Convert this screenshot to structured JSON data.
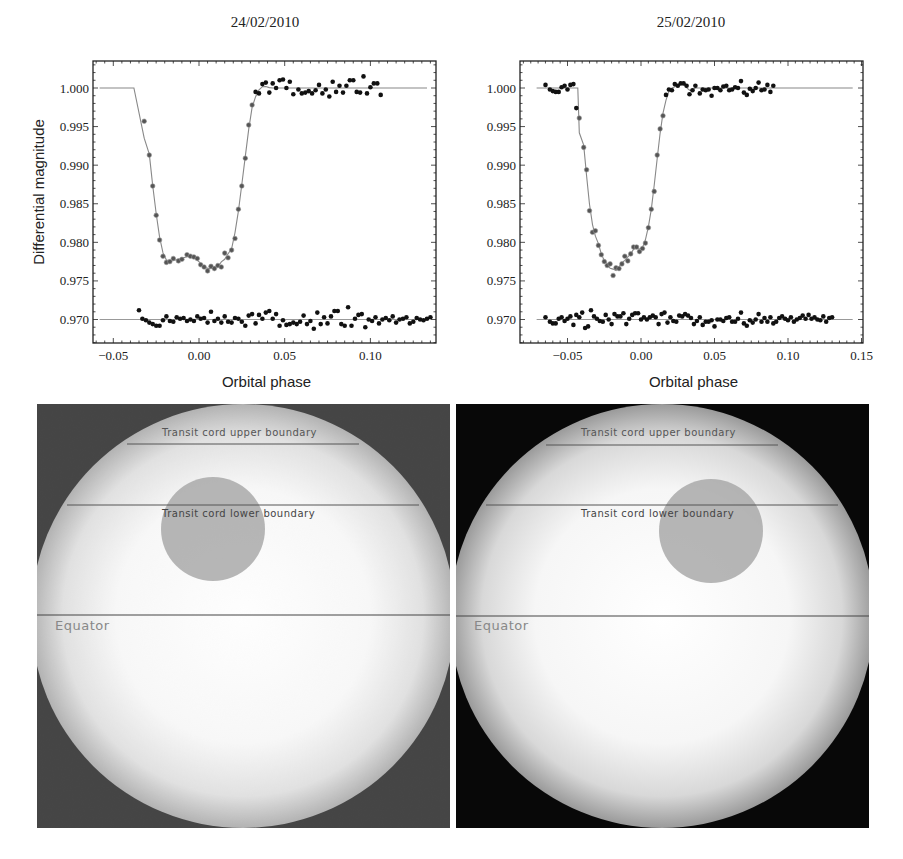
{
  "chart_data": [
    {
      "type": "scatter",
      "title": "24/02/2010",
      "xlabel": "Orbital phase",
      "ylabel": "Differential magnitude",
      "xlim": [
        -0.063,
        0.137
      ],
      "ylim": [
        0.9667,
        1.0035
      ],
      "xticks": [
        -0.05,
        0.0,
        0.05,
        0.1
      ],
      "xtick_labels": [
        "−0.05",
        "0.00",
        "0.05",
        "0.10"
      ],
      "yticks": [
        1.0,
        0.995,
        0.99,
        0.985,
        0.98,
        0.975,
        0.97
      ],
      "ytick_labels": [
        "1.000",
        "0.995",
        "0.990",
        "0.985",
        "0.980",
        "0.975",
        "0.970"
      ],
      "grid": false,
      "series": [
        {
          "name": "observed light curve",
          "style": "points",
          "x": [
            -0.032,
            -0.029,
            -0.027,
            -0.025,
            -0.023,
            -0.021,
            -0.019,
            -0.017,
            -0.015,
            -0.012,
            -0.01,
            -0.007,
            -0.005,
            -0.003,
            -0.001,
            0.001,
            0.003,
            0.005,
            0.007,
            0.009,
            0.011,
            0.013,
            0.015,
            0.017,
            0.019,
            0.021,
            0.023,
            0.025,
            0.027,
            0.029,
            0.031,
            0.033,
            0.035,
            0.037,
            0.039,
            0.041,
            0.043,
            0.045,
            0.047,
            0.049,
            0.051,
            0.053,
            0.055,
            0.058,
            0.06,
            0.062,
            0.064,
            0.066,
            0.068,
            0.07,
            0.072,
            0.074,
            0.076,
            0.078,
            0.08,
            0.082,
            0.084,
            0.086,
            0.088,
            0.09,
            0.092,
            0.094,
            0.096,
            0.098,
            0.1,
            0.102,
            0.104,
            0.106,
            0.108,
            0.11,
            0.112,
            0.114,
            0.116,
            0.118,
            0.12,
            0.122,
            0.124,
            0.126,
            0.128,
            0.13,
            0.132,
            0.134,
            0.136
          ],
          "y": [
            0.9957,
            0.9913,
            0.9873,
            0.9835,
            0.9803,
            0.9782,
            0.9774,
            0.9775,
            0.9779,
            0.9776,
            0.9778,
            0.9784,
            0.9782,
            0.9781,
            0.9779,
            0.9771,
            0.9768,
            0.9763,
            0.9769,
            0.9766,
            0.977,
            0.9768,
            0.9786,
            0.978,
            0.979,
            0.9805,
            0.9843,
            0.9873,
            0.9909,
            0.9952,
            0.9978,
            0.9995,
            0.9993,
            1.0005,
            1.0007,
            0.9994,
            1.0006,
            1.0,
            1.001,
            1.0011,
            1.0,
            1.0008,
            0.9992,
            0.9998,
            0.9993,
            0.9994,
            0.9996,
            0.9993,
            0.9997,
            1.0004,
            0.9993,
            0.9998,
            0.9989,
            1.0008,
            0.9995,
            1.0003,
            0.9994,
            1.0003,
            1.001,
            1.001,
            0.9995,
            0.9994,
            1.0015,
            0.9993,
            1.0001,
            1.0006,
            1.0006,
            0.9991
          ],
          "x_note": "x/y arrays are paired; points spanning full transit"
        },
        {
          "name": "model fit",
          "style": "line",
          "depth_center": 0.9765,
          "ingress_start": -0.038,
          "egress_end": 0.043,
          "baseline": 1.0
        },
        {
          "name": "residuals (offset 0.970)",
          "style": "points",
          "x": [
            -0.035,
            -0.033,
            -0.031,
            -0.029,
            -0.027,
            -0.025,
            -0.023,
            -0.021,
            -0.019,
            -0.017,
            -0.015,
            -0.013,
            -0.011,
            -0.009,
            -0.007,
            -0.005,
            -0.003,
            -0.001,
            0.001,
            0.003,
            0.005,
            0.007,
            0.009,
            0.011,
            0.013,
            0.015,
            0.017,
            0.019,
            0.021,
            0.023,
            0.025,
            0.027,
            0.029,
            0.031,
            0.033,
            0.035,
            0.037,
            0.039,
            0.041,
            0.043,
            0.045,
            0.047,
            0.049,
            0.051,
            0.053,
            0.055,
            0.057,
            0.059,
            0.061,
            0.063,
            0.065,
            0.067,
            0.069,
            0.071,
            0.073,
            0.075,
            0.077,
            0.079,
            0.081,
            0.083,
            0.085,
            0.087,
            0.089,
            0.091,
            0.093,
            0.095,
            0.097,
            0.099,
            0.101,
            0.103,
            0.105,
            0.107,
            0.109,
            0.111,
            0.113,
            0.115,
            0.117,
            0.119,
            0.121,
            0.123,
            0.125,
            0.127,
            0.129,
            0.131,
            0.133,
            0.135
          ],
          "y": [
            0.9712,
            0.9701,
            0.9699,
            0.9696,
            0.9694,
            0.9692,
            0.9692,
            0.9699,
            0.9704,
            0.9698,
            0.9697,
            0.9703,
            0.9701,
            0.9702,
            0.9698,
            0.97,
            0.9698,
            0.9704,
            0.9701,
            0.9702,
            0.9696,
            0.971,
            0.9698,
            0.9701,
            0.9696,
            0.9704,
            0.9697,
            0.9696,
            0.9702,
            0.9701,
            0.9697,
            0.9692,
            0.9705,
            0.9707,
            0.9695,
            0.9706,
            0.9701,
            0.9709,
            0.9711,
            0.9701,
            0.9707,
            0.9692,
            0.9699,
            0.9693,
            0.9694,
            0.9696,
            0.9694,
            0.9697,
            0.9705,
            0.9694,
            0.9698,
            0.9688,
            0.9709,
            0.9694,
            0.9703,
            0.9695,
            0.9704,
            0.9711,
            0.9711,
            0.9694,
            0.9692,
            0.9716,
            0.9692,
            0.9701,
            0.9706,
            0.9707,
            0.969,
            0.97,
            0.9698,
            0.9703,
            0.9695,
            0.97,
            0.9702,
            0.9699,
            0.9704,
            0.9696,
            0.97,
            0.9701,
            0.9703,
            0.9695,
            0.9697,
            0.9702,
            0.97,
            0.9699,
            0.9701,
            0.9703
          ]
        },
        {
          "name": "residual baseline",
          "style": "line",
          "y": 0.97
        }
      ]
    },
    {
      "type": "scatter",
      "title": "25/02/2010",
      "xlabel": "Orbital phase",
      "ylabel": "",
      "xlim": [
        -0.082,
        0.151
      ],
      "ylim": [
        0.9667,
        1.0035
      ],
      "xticks": [
        -0.05,
        0.0,
        0.05,
        0.1,
        0.15
      ],
      "xtick_labels": [
        "−0.05",
        "0.00",
        "0.05",
        "0.10",
        "0.15"
      ],
      "yticks": [
        1.0,
        0.995,
        0.99,
        0.985,
        0.98,
        0.975,
        0.97
      ],
      "ytick_labels": [
        "1.000",
        "0.995",
        "0.990",
        "0.985",
        "0.980",
        "0.975",
        "0.970"
      ],
      "grid": false,
      "series": [
        {
          "name": "observed light curve",
          "style": "points",
          "x": [
            -0.065,
            -0.062,
            -0.06,
            -0.058,
            -0.056,
            -0.054,
            -0.052,
            -0.05,
            -0.048,
            -0.046,
            -0.044,
            -0.042,
            -0.039,
            -0.037,
            -0.035,
            -0.033,
            -0.031,
            -0.029,
            -0.027,
            -0.025,
            -0.023,
            -0.021,
            -0.019,
            -0.017,
            -0.015,
            -0.013,
            -0.011,
            -0.009,
            -0.007,
            -0.005,
            -0.003,
            -0.001,
            0.001,
            0.003,
            0.005,
            0.007,
            0.009,
            0.011,
            0.013,
            0.015,
            0.017,
            0.019,
            0.021,
            0.023,
            0.025,
            0.027,
            0.029,
            0.031,
            0.033,
            0.035,
            0.037,
            0.04,
            0.042,
            0.044,
            0.046,
            0.048,
            0.05,
            0.052,
            0.054,
            0.056,
            0.058,
            0.06,
            0.062,
            0.064,
            0.066,
            0.068,
            0.07,
            0.072,
            0.074,
            0.076,
            0.078,
            0.08,
            0.082,
            0.084,
            0.086,
            0.088,
            0.09,
            0.092,
            0.094,
            0.096,
            0.098,
            0.1,
            0.102,
            0.104,
            0.106,
            0.108,
            0.11,
            0.112,
            0.114,
            0.116,
            0.118,
            0.12,
            0.122,
            0.124,
            0.126,
            0.128,
            0.13
          ],
          "y": [
            1.0004,
            0.9998,
            0.9996,
            0.9995,
            0.9995,
            1.0001,
            1.0003,
            0.9998,
            1.0004,
            1.0005,
            0.9974,
            0.9961,
            0.9923,
            0.9894,
            0.9841,
            0.9813,
            0.9815,
            0.9796,
            0.9784,
            0.9775,
            0.977,
            0.9772,
            0.9757,
            0.9767,
            0.9766,
            0.9772,
            0.9782,
            0.9776,
            0.9785,
            0.9794,
            0.9794,
            0.9788,
            0.9792,
            0.9799,
            0.9819,
            0.9843,
            0.9866,
            0.9913,
            0.9947,
            0.9964,
            0.9991,
            0.9998,
            0.9997,
            1.0005,
            1.0003,
            1.0006,
            1.0006,
            1.0003,
            0.9992,
            0.9997,
            1.0003,
            0.9993,
            0.9998,
            0.9997,
            0.9998,
            0.999,
            1.0,
            1.0,
            0.9997,
            1.0002,
            1.0003,
            0.9997,
            0.9998,
            1.0001,
            1.0,
            1.0009,
            0.9994,
            0.9991,
            0.9999,
            0.9996,
            1.0,
            1.0007,
            0.9997,
            0.9998,
            1.0004,
            0.9995,
            1.0003
          ],
          "x_note": "x/y arrays are paired"
        },
        {
          "name": "model fit",
          "style": "line",
          "depth_center": 0.9761,
          "ingress_start": -0.043,
          "egress_end": 0.039,
          "baseline": 1.0
        },
        {
          "name": "residuals (offset 0.970)",
          "style": "points",
          "x": [
            -0.065,
            -0.062,
            -0.06,
            -0.058,
            -0.056,
            -0.054,
            -0.052,
            -0.05,
            -0.048,
            -0.046,
            -0.044,
            -0.042,
            -0.04,
            -0.038,
            -0.036,
            -0.034,
            -0.032,
            -0.03,
            -0.028,
            -0.026,
            -0.024,
            -0.022,
            -0.02,
            -0.018,
            -0.016,
            -0.014,
            -0.012,
            -0.01,
            -0.008,
            -0.006,
            -0.004,
            -0.002,
            0.0,
            0.002,
            0.004,
            0.006,
            0.008,
            0.01,
            0.012,
            0.014,
            0.016,
            0.018,
            0.02,
            0.022,
            0.024,
            0.026,
            0.028,
            0.03,
            0.032,
            0.034,
            0.036,
            0.038,
            0.04,
            0.042,
            0.044,
            0.046,
            0.048,
            0.05,
            0.052,
            0.054,
            0.056,
            0.058,
            0.06,
            0.062,
            0.064,
            0.066,
            0.068,
            0.07,
            0.072,
            0.074,
            0.076,
            0.078,
            0.08,
            0.082,
            0.084,
            0.086,
            0.088,
            0.09,
            0.092,
            0.094,
            0.096,
            0.098,
            0.1,
            0.102,
            0.104,
            0.106,
            0.108,
            0.11,
            0.112,
            0.114,
            0.116,
            0.118,
            0.12,
            0.122,
            0.124,
            0.126,
            0.128,
            0.13
          ],
          "y": [
            0.9703,
            0.9697,
            0.9695,
            0.9695,
            0.9701,
            0.9703,
            0.9698,
            0.9701,
            0.9704,
            0.9693,
            0.9706,
            0.9703,
            0.9709,
            0.9689,
            0.9691,
            0.9712,
            0.9704,
            0.9701,
            0.9698,
            0.9697,
            0.9706,
            0.97,
            0.9694,
            0.9707,
            0.9704,
            0.9704,
            0.9708,
            0.9694,
            0.9701,
            0.9706,
            0.9708,
            0.9708,
            0.97,
            0.9703,
            0.97,
            0.9703,
            0.9705,
            0.9703,
            0.9694,
            0.9707,
            0.9709,
            0.9696,
            0.9703,
            0.9698,
            0.9697,
            0.9705,
            0.9704,
            0.9707,
            0.9705,
            0.9702,
            0.9694,
            0.9698,
            0.9703,
            0.9693,
            0.9697,
            0.9697,
            0.9699,
            0.9691,
            0.97,
            0.97,
            0.9698,
            0.9702,
            0.9703,
            0.9697,
            0.9697,
            0.9701,
            0.9709,
            0.9695,
            0.9692,
            0.9699,
            0.9696,
            0.97,
            0.9707,
            0.9697,
            0.9702,
            0.9697,
            0.9703,
            0.9695,
            0.9697,
            0.9702,
            0.9704,
            0.9701,
            0.9699,
            0.9703,
            0.9697,
            0.97,
            0.9702,
            0.9705,
            0.9701,
            0.9706,
            0.9701,
            0.9703,
            0.97,
            0.9699,
            0.9704,
            0.9697,
            0.9702,
            0.9703
          ]
        },
        {
          "name": "residual baseline",
          "style": "line",
          "y": 0.97
        }
      ]
    }
  ],
  "stellar_disk_panels": [
    {
      "date": "24/02/2010",
      "labels": {
        "upper": "Transit cord upper boundary",
        "lower": "Transit cord lower boundary",
        "equator": "Equator"
      },
      "spot_position": "left of center, between cord boundaries"
    },
    {
      "date": "25/02/2010",
      "labels": {
        "upper": "Transit cord upper boundary",
        "lower": "Transit cord lower boundary",
        "equator": "Equator"
      },
      "spot_position": "right of center, between cord boundaries"
    }
  ]
}
